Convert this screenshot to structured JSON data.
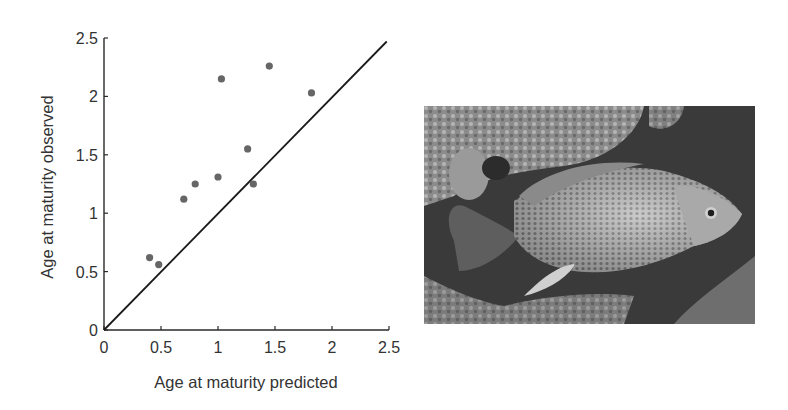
{
  "chart_data": {
    "type": "scatter",
    "title": "",
    "xlabel": "Age at maturity predicted",
    "ylabel": "Age at maturity observed",
    "xlim": [
      0,
      2.5
    ],
    "ylim": [
      0,
      2.5
    ],
    "x_ticks": [
      "0",
      "0.5",
      "1",
      "1.5",
      "2",
      "2.5"
    ],
    "y_ticks": [
      "0",
      "0.5",
      "1",
      "1.5",
      "2",
      "2.5"
    ],
    "grid": false,
    "legend": null,
    "series": [
      {
        "name": "observations",
        "points": [
          {
            "x": 0.4,
            "y": 0.62
          },
          {
            "x": 0.48,
            "y": 0.56
          },
          {
            "x": 0.7,
            "y": 1.12
          },
          {
            "x": 0.8,
            "y": 1.25
          },
          {
            "x": 1.0,
            "y": 1.31
          },
          {
            "x": 1.03,
            "y": 2.15
          },
          {
            "x": 1.26,
            "y": 1.55
          },
          {
            "x": 1.31,
            "y": 1.25
          },
          {
            "x": 1.45,
            "y": 2.26
          },
          {
            "x": 1.82,
            "y": 2.03
          }
        ],
        "color": "#666666"
      },
      {
        "name": "1:1 line",
        "type": "line",
        "points": [
          {
            "x": 0,
            "y": 0
          },
          {
            "x": 2.48,
            "y": 2.47
          }
        ],
        "color": "#1a1a1a"
      }
    ]
  },
  "photo": {
    "subject": "fish-photograph",
    "description": "Grayscale photo of a scaled fish swimming left-to-right near rocks"
  },
  "colors": {
    "axis": "#2a2a2a",
    "text": "#333333",
    "points": "#666666",
    "line": "#1a1a1a"
  }
}
